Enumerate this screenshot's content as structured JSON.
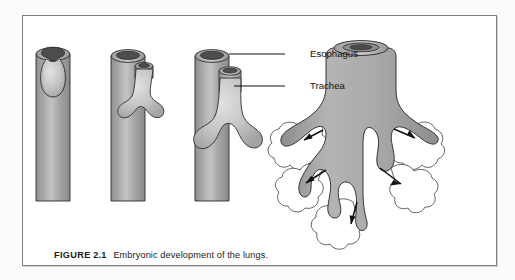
{
  "figure": {
    "caption_label": "FIGURE",
    "caption_number": "2.1",
    "caption_text": "Embryonic development of the lungs.",
    "border_color": "#7d7f82",
    "page_background": "#fbfbfb",
    "panel_background": "#ffffff"
  },
  "annotations": {
    "esophagus": "Esophagus",
    "trachea": "Trachea"
  },
  "diagram": {
    "title": "Embryonic development of the lungs",
    "tissue_fill_color": "#a8a8a8",
    "tissue_highlight_color": "#d0d0d0",
    "lumen_color": "#4a4a4a",
    "outline_color": "#1a1a1a",
    "alveoli_fill_color": "#ffffff",
    "stages": [
      {
        "index": 1,
        "name": "stage-1-lung-bud",
        "description": "Foregut tube with single ventral lung bud diverticulum"
      },
      {
        "index": 2,
        "name": "stage-2-bifurcation",
        "description": "Trachea separating from esophagus with bilobed bud"
      },
      {
        "index": 3,
        "name": "stage-3-bronchi",
        "description": "Distinct trachea and esophagus with elongating primary bronchi"
      },
      {
        "index": 4,
        "name": "stage-4-bronchial-tree",
        "description": "Branched bronchial tree surrounded by developing alveolar lobules"
      }
    ],
    "growth_arrow_count": 5
  }
}
